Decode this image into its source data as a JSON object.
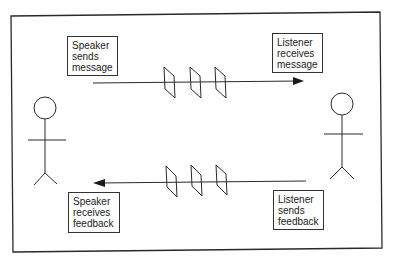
{
  "diagram": {
    "title": "",
    "actors": [
      {
        "id": "speaker",
        "name": "Speaker (stick figure)"
      },
      {
        "id": "listener",
        "name": "Listener (stick figure)"
      }
    ],
    "labels": {
      "speaker_sends": [
        "Speaker",
        "sends",
        "message"
      ],
      "listener_receives": [
        "Listener",
        "receives",
        "message"
      ],
      "listener_sends": [
        "Listener",
        "sends",
        "feedback"
      ],
      "speaker_receives": [
        "Speaker",
        "receives",
        "feedback"
      ]
    },
    "flows": [
      {
        "from": "speaker",
        "to": "listener",
        "label": "message",
        "direction": "right",
        "barriers": 3
      },
      {
        "from": "listener",
        "to": "speaker",
        "label": "feedback",
        "direction": "left",
        "barriers": 3
      }
    ],
    "colors": {
      "stroke": "#2a2a2a",
      "background": "#ffffff"
    }
  }
}
